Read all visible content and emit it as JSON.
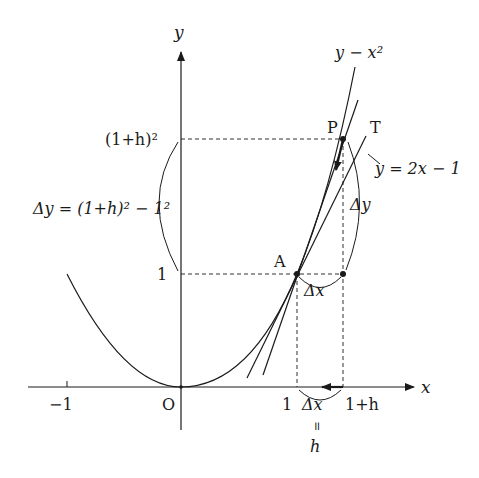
{
  "figure": {
    "type": "derivative-secant-tangent-diagram",
    "colors": {
      "ink": "#1a1a1a",
      "background": "#ffffff"
    }
  },
  "axes": {
    "x_label": "x",
    "y_label": "y",
    "origin_label": "O",
    "x_ticks": [
      {
        "label": "−1"
      },
      {
        "label": "1"
      },
      {
        "label": "1+h"
      }
    ],
    "y_ticks": [
      {
        "label": "1"
      },
      {
        "label": "(1+h)²"
      }
    ]
  },
  "curves": {
    "parabola_label": "y − x²",
    "tangent_label": "y = 2x − 1",
    "tangent_point_label": "T"
  },
  "points": {
    "A": "A",
    "P": "P"
  },
  "annotations": {
    "delta_y_full": "Δy = (1+h)² − 1²",
    "delta_y": "Δy",
    "delta_x_top": "Δx",
    "delta_x_bottom": "Δx",
    "equals_sign": "॥",
    "h": "h"
  }
}
